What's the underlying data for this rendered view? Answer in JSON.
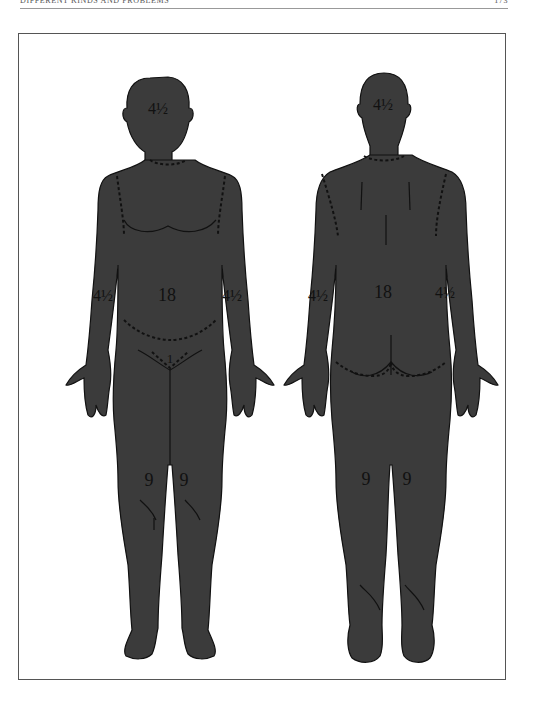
{
  "running_head": {
    "title": "Different Kinds and Problems",
    "page_number": "173"
  },
  "figure": {
    "fill_color": "#3b3b3b",
    "front_view": {
      "head": "4½",
      "trunk": "18",
      "right_arm": "4½",
      "left_arm": "4½",
      "genitals": "1",
      "right_leg": "9",
      "left_leg": "9"
    },
    "back_view": {
      "head": "4½",
      "trunk": "18",
      "right_arm": "4½",
      "left_arm": "4½",
      "right_leg": "9",
      "left_leg": "9"
    }
  }
}
